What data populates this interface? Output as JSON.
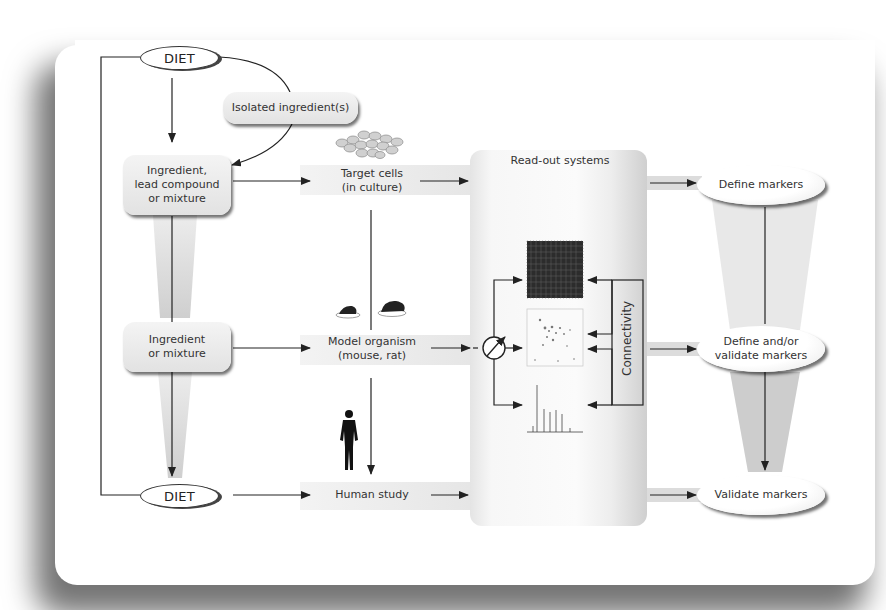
{
  "nodes": {
    "diet_top": "DIET",
    "isolated": "Isolated ingredient(s)",
    "ingredient_lead": [
      "Ingredient,",
      "lead compound",
      "or mixture"
    ],
    "target_cells": [
      "Target cells",
      "(in culture)"
    ],
    "ingredient_mix": [
      "Ingredient",
      "or mixture"
    ],
    "model_organism": [
      "Model organism",
      "(mouse, rat)"
    ],
    "diet_bottom": "DIET",
    "human_study": "Human study",
    "readout": "Read-out systems",
    "connectivity": "Connectivity",
    "define_markers": "Define markers",
    "define_validate": [
      "Define and/or",
      "validate markers"
    ],
    "validate_markers": "Validate markers"
  },
  "icons": {
    "cells": "cell-cluster-icon",
    "rodents": "mouse-rat-icon",
    "human": "human-silhouette-icon",
    "microarray": "microarray-icon",
    "gel": "2d-gel-icon",
    "spectrum": "mass-spectrum-icon",
    "switch": "selector-switch-icon"
  },
  "colors": {
    "line": "#222222",
    "band": "#e6e6e6",
    "funnel": "#d9d9d9",
    "card": "#ffffff"
  }
}
